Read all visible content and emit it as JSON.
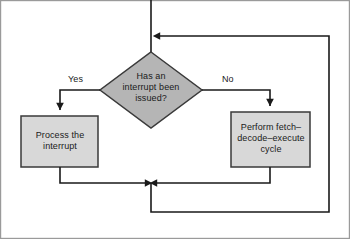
{
  "diagram": {
    "type": "flowchart",
    "colors": {
      "decision_fill": "#b5b5b5",
      "process_fill": "#d8d8d8",
      "shape_stroke": "#3a3a3a",
      "line_stroke": "#1a1a1a",
      "frame_stroke": "#9a9a9a",
      "text": "#1a1a1a",
      "background": "#ffffff"
    },
    "nodes": {
      "decision": {
        "shape": "diamond",
        "text": "Has an\ninterrupt been\nissued?",
        "lines": [
          "Has an",
          "interrupt been",
          "issued?"
        ]
      },
      "process_interrupt": {
        "shape": "rectangle",
        "text": "Process the\ninterrupt",
        "lines": [
          "Process the",
          "interrupt"
        ]
      },
      "fetch_cycle": {
        "shape": "rectangle",
        "text": "Perform fetch–\ndecode–execute\ncycle",
        "lines": [
          "Perform fetch–",
          "decode–execute",
          "cycle"
        ]
      }
    },
    "branch_labels": {
      "yes": "Yes",
      "no": "No"
    },
    "edges": [
      {
        "name": "entry-to-decision",
        "from": "top",
        "to": "decision",
        "label": ""
      },
      {
        "name": "decision-yes-to-process",
        "from": "decision",
        "to": "process_interrupt",
        "label": "Yes"
      },
      {
        "name": "decision-no-to-fetch",
        "from": "decision",
        "to": "fetch_cycle",
        "label": "No"
      },
      {
        "name": "process-to-merge",
        "from": "process_interrupt",
        "to": "merge",
        "label": ""
      },
      {
        "name": "fetch-to-merge",
        "from": "fetch_cycle",
        "to": "merge",
        "label": ""
      },
      {
        "name": "merge-feedback-to-top",
        "from": "merge",
        "to": "decision",
        "label": ""
      }
    ]
  }
}
